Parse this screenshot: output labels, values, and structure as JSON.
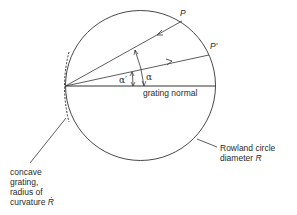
{
  "diagram": {
    "labels": {
      "point_p": "P",
      "point_p_prime": "P′",
      "alpha": "α",
      "alpha_prime": "α′",
      "grating_normal": "grating normal",
      "rowland_line1": "Rowland circle",
      "rowland_line2_text": "diameter ",
      "rowland_line2_symbol": "R",
      "grating_line1": "concave",
      "grating_line2": "grating,",
      "grating_line3": "radius of",
      "grating_line4_text": "curvature ",
      "grating_line4_symbol": "Ṙ"
    },
    "geometry": {
      "circle_center": [
        140,
        85
      ],
      "circle_radius": 75,
      "grating_vertex": [
        65,
        86
      ],
      "P": [
        182,
        21
      ],
      "P_prime": [
        209,
        54
      ],
      "normal_end": [
        216,
        86
      ]
    },
    "colors": {
      "stroke": "#333333",
      "text": "#2a2a2a"
    }
  }
}
